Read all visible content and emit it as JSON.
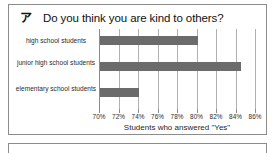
{
  "panel": {
    "question_marker": "ア",
    "question_title": "Do you think you are kind to others?"
  },
  "chart_data": {
    "type": "bar",
    "orientation": "horizontal",
    "title": "Do you think you are kind to others?",
    "xlabel": "Students who answered \"Yes\"",
    "ylabel": "",
    "categories": [
      "high school students",
      "junior high school students",
      "elementary school students"
    ],
    "values": [
      80.0,
      84.5,
      74.0
    ],
    "xlim": [
      70,
      86
    ],
    "xticks": [
      70,
      72,
      74,
      76,
      78,
      80,
      82,
      84,
      86
    ],
    "xtick_labels": [
      "70%",
      "72%",
      "74%",
      "76%",
      "78%",
      "80%",
      "82%",
      "84%",
      "86%"
    ],
    "grid": true,
    "legend": false,
    "bar_color": "#6b6b6b",
    "grid_color": "#b0b0b0",
    "unit": "%"
  }
}
